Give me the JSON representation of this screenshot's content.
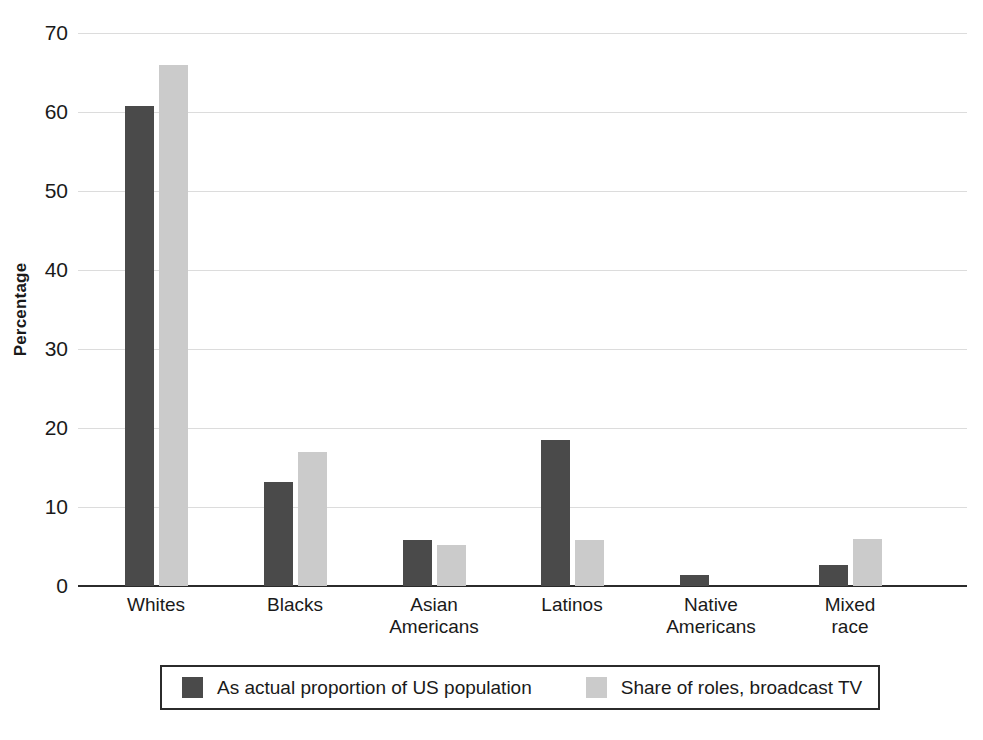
{
  "chart_data": {
    "type": "bar",
    "title": "",
    "subtitle": "",
    "xlabel": "",
    "ylabel": "Percentage",
    "ylim": [
      0,
      70
    ],
    "yticks": [
      0,
      10,
      20,
      30,
      40,
      50,
      60,
      70
    ],
    "ytick_labels": [
      "0",
      "10",
      "20",
      "30",
      "40",
      "50",
      "60",
      "70"
    ],
    "grid": true,
    "grid_axis": "y",
    "legend_position": "bottom",
    "categories": [
      "Whites",
      "Blacks",
      "Asian Americans",
      "Latinos",
      "Native Americans",
      "Mixed race"
    ],
    "category_label_lines": [
      [
        "Whites"
      ],
      [
        "Blacks"
      ],
      [
        "Asian",
        "Americans"
      ],
      [
        "Latinos"
      ],
      [
        "Native",
        "Americans"
      ],
      [
        "Mixed",
        "race"
      ]
    ],
    "series": [
      {
        "name": "As actual proportion of US population",
        "color": "#4a4a4a",
        "values": [
          60.7,
          13.2,
          5.8,
          18.5,
          1.4,
          2.6
        ]
      },
      {
        "name": "Share of roles, broadcast TV",
        "color": "#cbcbcb",
        "values": [
          66.0,
          17.0,
          5.2,
          5.8,
          0.0,
          6.0
        ]
      }
    ]
  },
  "legend": {
    "entries": [
      {
        "label": "As actual proportion of US population",
        "color": "#4a4a4a"
      },
      {
        "label": "Share of roles, broadcast TV",
        "color": "#cbcbcb"
      }
    ]
  },
  "axis": {
    "y_title": "Percentage"
  },
  "colors": {
    "series_dark": "#4a4a4a",
    "series_light": "#cbcbcb",
    "gridline": "#dcdcdc",
    "axis": "#2b2b2b",
    "text": "#1a1a1a",
    "background": "#ffffff"
  }
}
